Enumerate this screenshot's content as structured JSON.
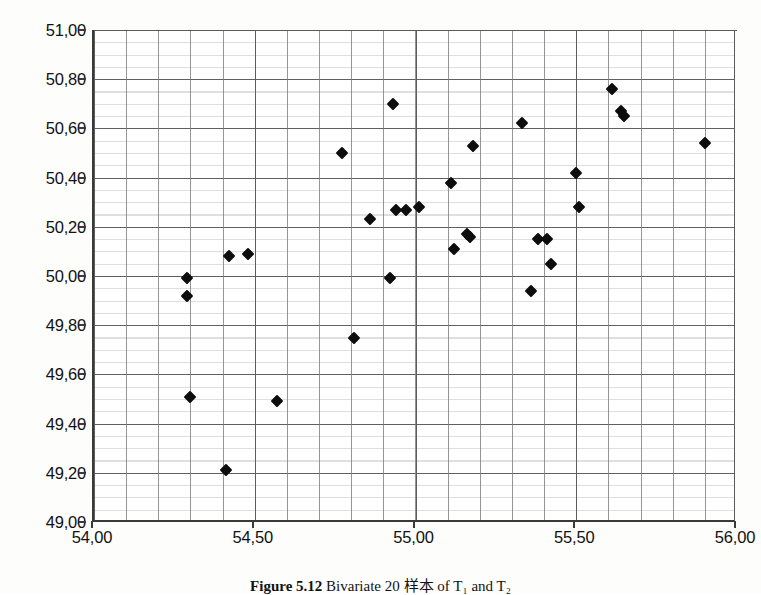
{
  "figure": {
    "caption_label": "Figure 5.12",
    "caption_text": "Bivariate 20 样本 of T₁ and T₂",
    "caption_separator": "  "
  },
  "axes": {
    "x_ticks": [
      "54,00",
      "54,50",
      "55,00",
      "55,50",
      "56,00"
    ],
    "x_tick_values": [
      54.0,
      54.5,
      55.0,
      55.5,
      56.0
    ],
    "y_ticks": [
      "49,00",
      "49,20",
      "49,40",
      "49,60",
      "49,80",
      "50,00",
      "50,20",
      "50,40",
      "50,60",
      "50,80",
      "51,00"
    ],
    "y_tick_values": [
      49.0,
      49.2,
      49.4,
      49.6,
      49.8,
      50.0,
      50.2,
      50.4,
      50.6,
      50.8,
      51.0
    ],
    "x_min": 54.0,
    "x_max": 56.0,
    "y_min": 49.0,
    "y_max": 51.0,
    "decimal_separator": ",",
    "grid": true,
    "x_minor_step": 0.1,
    "y_minor_step": 0.05,
    "axis_color": "#3a3a3a",
    "grid_color": "#5a5a5a",
    "marker_color": "#0d0d0d"
  },
  "chart_data": {
    "type": "scatter",
    "title": "",
    "xlabel": "",
    "ylabel": "",
    "xlim": [
      54.0,
      56.0
    ],
    "ylim": [
      49.0,
      51.0
    ],
    "grid": true,
    "legend": "none",
    "marker": "diamond",
    "series": [
      {
        "name": "sample",
        "points": [
          [
            54.29,
            49.99
          ],
          [
            54.29,
            49.92
          ],
          [
            54.3,
            49.51
          ],
          [
            54.41,
            49.21
          ],
          [
            54.42,
            50.08
          ],
          [
            54.48,
            50.09
          ],
          [
            54.57,
            49.49
          ],
          [
            54.77,
            50.5
          ],
          [
            54.81,
            49.75
          ],
          [
            54.86,
            50.23
          ],
          [
            54.92,
            49.99
          ],
          [
            54.93,
            50.7
          ],
          [
            54.94,
            50.27
          ],
          [
            54.97,
            50.27
          ],
          [
            55.01,
            50.28
          ],
          [
            55.11,
            50.38
          ],
          [
            55.12,
            50.11
          ],
          [
            55.16,
            50.17
          ],
          [
            55.17,
            50.16
          ],
          [
            55.18,
            50.53
          ],
          [
            55.33,
            50.62
          ],
          [
            55.36,
            49.94
          ],
          [
            55.38,
            50.15
          ],
          [
            55.41,
            50.15
          ],
          [
            55.42,
            50.05
          ],
          [
            55.5,
            50.42
          ],
          [
            55.51,
            50.28
          ],
          [
            55.61,
            50.76
          ],
          [
            55.64,
            50.67
          ],
          [
            55.65,
            50.65
          ],
          [
            55.9,
            50.54
          ]
        ]
      }
    ]
  }
}
